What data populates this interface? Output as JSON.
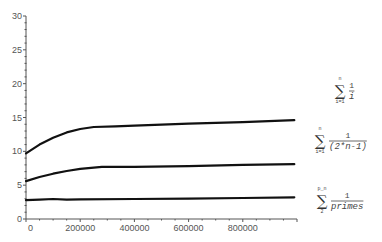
{
  "chart_data": {
    "type": "line",
    "title": "",
    "xlabel": "",
    "ylabel": "",
    "xlim": [
      0,
      1000000
    ],
    "ylim": [
      0,
      30
    ],
    "grid": false,
    "x_ticks": [
      0,
      200000,
      400000,
      600000,
      800000
    ],
    "x_tick_labels": [
      "0",
      "200000",
      "400000",
      "600000",
      "800000"
    ],
    "y_ticks": [
      0,
      5,
      10,
      15,
      20,
      25,
      30
    ],
    "y_tick_labels": [
      "0",
      "5",
      "10",
      "15",
      "20",
      "25",
      "30"
    ],
    "series": [
      {
        "name": "sum_{i=1}^{n} 1/i",
        "legend": {
          "top": "n",
          "bottom": "i=1",
          "numerator": "1",
          "denominator": "i"
        },
        "x": [
          0,
          50000,
          100000,
          150000,
          200000,
          250000,
          330000,
          400000,
          600000,
          800000,
          990000
        ],
        "values": [
          9.7,
          11.0,
          12.0,
          12.8,
          13.3,
          13.6,
          13.7,
          13.8,
          14.1,
          14.3,
          14.6
        ]
      },
      {
        "name": "sum_{i=1}^{n} 1/(2*n-1)",
        "legend": {
          "top": "n",
          "bottom": "i=1",
          "numerator": "1",
          "denominator": "(2*n-1)"
        },
        "x": [
          0,
          50000,
          100000,
          150000,
          200000,
          280000,
          350000,
          400000,
          600000,
          800000,
          990000
        ],
        "values": [
          5.6,
          6.2,
          6.7,
          7.1,
          7.4,
          7.7,
          7.7,
          7.7,
          7.8,
          8.0,
          8.1
        ]
      },
      {
        "name": "sum_{2}^{p_n} 1/primes",
        "legend": {
          "top": "p_n",
          "bottom": "2",
          "numerator": "1",
          "denominator": "primes"
        },
        "x": [
          0,
          50000,
          100000,
          150000,
          200000,
          400000,
          600000,
          800000,
          990000
        ],
        "values": [
          2.8,
          2.85,
          2.95,
          2.85,
          2.9,
          2.95,
          3.0,
          3.1,
          3.2
        ]
      }
    ],
    "legend_placement": "right",
    "line_color": "#111111"
  }
}
